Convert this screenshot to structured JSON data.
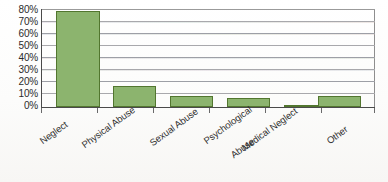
{
  "chart_data": {
    "type": "bar",
    "title": "",
    "subtitle": "",
    "xlabel": "",
    "ylabel": "",
    "categories": [
      "Neglect",
      "Physical Abuse",
      "Sexual Abuse",
      "Psychological\nAbuse",
      "Medical Neglect",
      "Other"
    ],
    "values": [
      78,
      17,
      9,
      7.5,
      2,
      9
    ],
    "value_unit": "%",
    "ylim": [
      0,
      80
    ],
    "y_ticks": [
      0,
      10,
      20,
      30,
      40,
      50,
      60,
      70,
      80
    ],
    "y_tick_labels": [
      "0%",
      "10%",
      "20%",
      "30%",
      "40%",
      "50%",
      "60%",
      "70%",
      "80%"
    ],
    "grid": true,
    "grid_axis": "y",
    "legend": "none",
    "series": [
      {
        "name": "Percent of cases",
        "values": [
          78,
          17,
          9,
          7.5,
          2,
          9
        ]
      }
    ]
  },
  "axes": {
    "y_labels": [
      {
        "text": "80%",
        "value": 80
      },
      {
        "text": "70%",
        "value": 70
      },
      {
        "text": "60%",
        "value": 60
      },
      {
        "text": "50%",
        "value": 50
      },
      {
        "text": "40%",
        "value": 40
      },
      {
        "text": "30%",
        "value": 30
      },
      {
        "text": "20%",
        "value": 20
      },
      {
        "text": "10%",
        "value": 10
      },
      {
        "text": "0%",
        "value": 0
      }
    ],
    "x_labels": [
      {
        "line1": "Neglect",
        "line2": ""
      },
      {
        "line1": "Physical Abuse",
        "line2": ""
      },
      {
        "line1": "Sexual Abuse",
        "line2": ""
      },
      {
        "line1": "Psychological",
        "line2": "Abuse"
      },
      {
        "line1": "Medical Neglect",
        "line2": ""
      },
      {
        "line1": "Other",
        "line2": ""
      }
    ]
  },
  "colors": {
    "bar_fill": "#8cb46e",
    "bar_border": "#52762f",
    "gridline": "#9a9a9a",
    "axis_line": "#4a4a4a",
    "text": "#2b2b2b",
    "background": "#fdfdfd"
  }
}
